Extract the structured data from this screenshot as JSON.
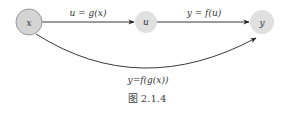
{
  "diagram": {
    "nodes": [
      {
        "id": "x",
        "label": "x",
        "cx": 29,
        "cy": 22,
        "r": 13,
        "fill": "#d4d4d4",
        "stroke": "#9a9a9a"
      },
      {
        "id": "u",
        "label": "u",
        "cx": 146,
        "cy": 22,
        "r": 11,
        "fill": "#e0e0e0",
        "stroke": "none"
      },
      {
        "id": "y",
        "label": "y",
        "cx": 262,
        "cy": 22,
        "r": 12,
        "fill": "#e0e0e0",
        "stroke": "none"
      }
    ],
    "edges": [
      {
        "from": "x",
        "to": "u",
        "label": "u = g(x)"
      },
      {
        "from": "u",
        "to": "y",
        "label": "y = f(u)"
      },
      {
        "from": "x",
        "to": "y",
        "label": "y=f(g(x))",
        "curved": true
      }
    ],
    "caption": "图 2.1.4",
    "colors": {
      "edge": "#222222",
      "text": "#333333"
    }
  }
}
